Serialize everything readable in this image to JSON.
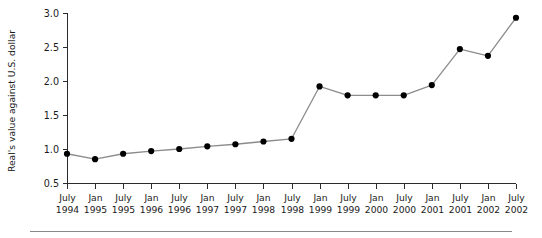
{
  "chart_data": {
    "type": "line",
    "title": "",
    "subtitle": "",
    "xlabel": "",
    "ylabel": "Real's value against U.S. dollar",
    "ylim": [
      0.5,
      3.0
    ],
    "ytick_values": [
      0.5,
      1.0,
      1.5,
      2.0,
      2.5,
      3.0
    ],
    "ytick_labels": [
      "0.5",
      "1.0",
      "1.5",
      "2.0",
      "2.5",
      "3.0"
    ],
    "grid": false,
    "legend": null,
    "legend_position": "none",
    "categories": [
      "July 1994",
      "Jan 1995",
      "July 1995",
      "Jan 1996",
      "July 1996",
      "Jan 1997",
      "July 1997",
      "Jan 1998",
      "July 1998",
      "Jan 1999",
      "July 1999",
      "Jan 2000",
      "July 2000",
      "Jan 2001",
      "July 2001",
      "Jan 2002",
      "July 2002"
    ],
    "xtick_labels": [
      {
        "month": "July",
        "year": "1994"
      },
      {
        "month": "Jan",
        "year": "1995"
      },
      {
        "month": "July",
        "year": "1995"
      },
      {
        "month": "Jan",
        "year": "1996"
      },
      {
        "month": "July",
        "year": "1996"
      },
      {
        "month": "Jan",
        "year": "1997"
      },
      {
        "month": "July",
        "year": "1997"
      },
      {
        "month": "Jan",
        "year": "1998"
      },
      {
        "month": "July",
        "year": "1998"
      },
      {
        "month": "Jan",
        "year": "1999"
      },
      {
        "month": "July",
        "year": "1999"
      },
      {
        "month": "Jan",
        "year": "2000"
      },
      {
        "month": "July",
        "year": "2000"
      },
      {
        "month": "Jan",
        "year": "2001"
      },
      {
        "month": "July",
        "year": "2001"
      },
      {
        "month": "Jan",
        "year": "2002"
      },
      {
        "month": "July",
        "year": "2002"
      }
    ],
    "values": [
      0.93,
      0.85,
      0.93,
      0.97,
      1.0,
      1.04,
      1.07,
      1.11,
      1.15,
      1.92,
      1.79,
      1.79,
      1.79,
      1.94,
      2.47,
      2.37,
      2.93
    ],
    "colors": {
      "line": "#8c8c8c",
      "marker": "#000000",
      "axis": "#2b2b2b",
      "text": "#1a1a1a",
      "background": "#ffffff",
      "footer_rule": "#8a8a8a"
    }
  }
}
